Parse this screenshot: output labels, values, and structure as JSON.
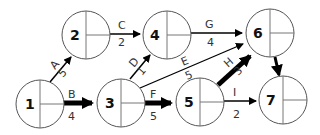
{
  "diagram": {
    "type": "activity-on-node network",
    "nodes": [
      {
        "id": "1",
        "label": "1",
        "cx": 40,
        "cy": 104
      },
      {
        "id": "2",
        "label": "2",
        "cx": 86,
        "cy": 35
      },
      {
        "id": "3",
        "label": "3",
        "cx": 121,
        "cy": 103
      },
      {
        "id": "4",
        "label": "4",
        "cx": 167,
        "cy": 35
      },
      {
        "id": "5",
        "label": "5",
        "cx": 200,
        "cy": 102
      },
      {
        "id": "6",
        "label": "6",
        "cx": 270,
        "cy": 33
      },
      {
        "id": "7",
        "label": "7",
        "cx": 283,
        "cy": 100
      }
    ],
    "edges": [
      {
        "letter": "A",
        "weight": "5",
        "from": "1",
        "to": "2",
        "critical": false
      },
      {
        "letter": "B",
        "weight": "4",
        "from": "1",
        "to": "3",
        "critical": true
      },
      {
        "letter": "C",
        "weight": "2",
        "from": "2",
        "to": "4",
        "critical": false
      },
      {
        "letter": "D",
        "weight": "1",
        "from": "3",
        "to": "4",
        "critical": false
      },
      {
        "letter": "E",
        "weight": "5",
        "from": "3",
        "to": "6",
        "critical": false
      },
      {
        "letter": "F",
        "weight": "5",
        "from": "3",
        "to": "5",
        "critical": true
      },
      {
        "letter": "G",
        "weight": "4",
        "from": "4",
        "to": "6",
        "critical": false
      },
      {
        "letter": "H",
        "weight": "3",
        "from": "5",
        "to": "6",
        "critical": true
      },
      {
        "letter": "I",
        "weight": "2",
        "from": "5",
        "to": "7",
        "critical": false
      },
      {
        "letter": "",
        "weight": "",
        "from": "6",
        "to": "7",
        "critical": true
      }
    ]
  }
}
